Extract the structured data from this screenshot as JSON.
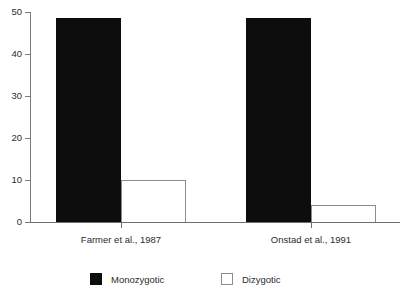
{
  "chart_data": {
    "type": "bar",
    "title": "",
    "subtitle": "",
    "xlabel": "",
    "ylabel": "",
    "categories": [
      "Farmer et al., 1987",
      "Onstad et al., 1991"
    ],
    "series": [
      {
        "name": "Monozygotic",
        "color": "#0d0d0d",
        "values": [
          48.5,
          48.5
        ]
      },
      {
        "name": "Dizygotic",
        "color": "#ffffff",
        "values": [
          10,
          4
        ]
      }
    ],
    "ylim": [
      0,
      50
    ],
    "yticks": [
      0,
      10,
      20,
      30,
      40,
      50
    ],
    "ytick_labels": [
      "0",
      "10",
      "20",
      "30",
      "40",
      "50"
    ],
    "grid": false,
    "legend_position": "bottom",
    "legend_entries": [
      "Monozygotic",
      "Dizygotic"
    ],
    "bar_grouping": "adjacent",
    "annotations": []
  },
  "axis": {
    "y_labels": [
      "50",
      "40",
      "30",
      "20",
      "10",
      "0"
    ]
  },
  "legend": {
    "mono_label": "Monozygotic",
    "di_label": "Dizygotic"
  }
}
